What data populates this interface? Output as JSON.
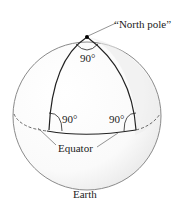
{
  "diagram": {
    "labels": {
      "north_pole": "“North pole”",
      "angle_top": "90°",
      "angle_left": "90°",
      "angle_right": "90°",
      "equator": "Equator",
      "earth": "Earth"
    },
    "colors": {
      "sphere_outline": "#8a8a8a",
      "triangle_edges": "#222222",
      "shading": "#e6e6e6"
    }
  }
}
